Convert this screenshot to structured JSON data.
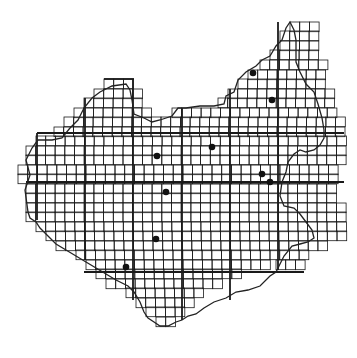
{
  "map": {
    "type": "grid-distribution-map",
    "cell_size": 9.6,
    "origin": [
      0,
      0
    ],
    "line_color": "#1a1a1a",
    "dot_color": "#111111",
    "rows": [
      {
        "y": 13,
        "x0": 27,
        "x1": 29
      },
      {
        "y": 14,
        "x0": 27,
        "x1": 29
      },
      {
        "y": 15,
        "x0": 26,
        "x1": 29
      },
      {
        "y": 16,
        "x0": 26,
        "x1": 29
      },
      {
        "y": 17,
        "x0": 25,
        "x1": 29
      },
      {
        "y": 18,
        "x0": 24,
        "x1": 30
      },
      {
        "y": 19,
        "x0": 23,
        "x1": 30
      },
      {
        "y": 20,
        "x0": 22,
        "x1": 31
      },
      {
        "y": 21,
        "x0": 22,
        "x1": 31
      },
      {
        "y": 22,
        "x0": 21,
        "x1": 31
      },
      {
        "y": 23,
        "x0": 12,
        "x1": 32
      },
      {
        "y": 24,
        "x0": 12,
        "x1": 32
      },
      {
        "y": 25,
        "x0": 10,
        "x1": 32
      },
      {
        "y": 26,
        "x0": 9,
        "x1": 33
      },
      {
        "y": 27,
        "x0": 8,
        "x1": 33
      },
      {
        "y": 28,
        "x0": 7,
        "x1": 33
      },
      {
        "y": 29,
        "x0": 6,
        "x1": 33
      },
      {
        "y": 30,
        "x0": 5,
        "x1": 33
      },
      {
        "y": 31,
        "x0": 5,
        "x1": 33
      }
    ],
    "dots": [
      {
        "x": 253,
        "y": 73
      },
      {
        "x": 272,
        "y": 100
      },
      {
        "x": 212,
        "y": 147
      },
      {
        "x": 157,
        "y": 156
      },
      {
        "x": 166,
        "y": 192
      },
      {
        "x": 262,
        "y": 174
      },
      {
        "x": 270,
        "y": 182
      },
      {
        "x": 156,
        "y": 239
      },
      {
        "x": 126,
        "y": 267
      }
    ]
  }
}
